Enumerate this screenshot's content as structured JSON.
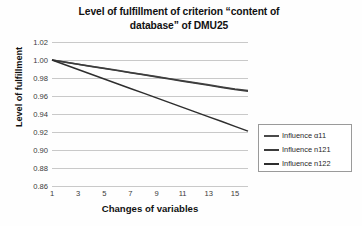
{
  "chart_data": {
    "type": "line",
    "title": "Level of fulfillment of criterion “content of database” of DMU25",
    "title_line1": "Level of fulfillment of criterion “content of",
    "title_line2": "database” of DMU25",
    "xlabel": "Changes of variables",
    "ylabel": "Level of fulfillment",
    "grid": true,
    "legend_position": "right",
    "ylim": [
      0.86,
      1.02
    ],
    "yticks": [
      "1.02",
      "1.00",
      "0.98",
      "0.96",
      "0.94",
      "0.92",
      "0.90",
      "0.88",
      "0.86"
    ],
    "ytick_values": [
      1.02,
      1.0,
      0.98,
      0.96,
      0.94,
      0.92,
      0.9,
      0.88,
      0.86
    ],
    "xlim": [
      1,
      16
    ],
    "xticks": [
      "1",
      "3",
      "5",
      "7",
      "9",
      "11",
      "13",
      "15"
    ],
    "xtick_values": [
      1,
      3,
      5,
      7,
      9,
      11,
      13,
      15
    ],
    "x": [
      1,
      2,
      3,
      4,
      5,
      6,
      7,
      8,
      9,
      10,
      11,
      12,
      13,
      14,
      15,
      16
    ],
    "series": [
      {
        "name": "Influence α11",
        "color": "#4a4a4a",
        "values": [
          1.0,
          0.9977,
          0.9954,
          0.9931,
          0.9908,
          0.9885,
          0.9862,
          0.9839,
          0.9816,
          0.9793,
          0.977,
          0.9747,
          0.9724,
          0.9701,
          0.9678,
          0.966
        ]
      },
      {
        "name": "Influence n121",
        "color": "#3c3c3c",
        "values": [
          1.0,
          0.9976,
          0.9953,
          0.9929,
          0.9906,
          0.9882,
          0.9859,
          0.9835,
          0.9812,
          0.9788,
          0.9765,
          0.9741,
          0.9718,
          0.9694,
          0.9671,
          0.9652
        ]
      },
      {
        "name": "Influence n122",
        "color": "#2e2e2e",
        "values": [
          1.0,
          0.9947,
          0.9895,
          0.9842,
          0.9789,
          0.9737,
          0.9684,
          0.9632,
          0.9579,
          0.9526,
          0.9474,
          0.9421,
          0.9368,
          0.9316,
          0.9263,
          0.921
        ]
      }
    ]
  },
  "legend": {
    "items": [
      {
        "label": "Influence α11"
      },
      {
        "label": "Influence n121"
      },
      {
        "label": "Influence n122"
      }
    ]
  }
}
